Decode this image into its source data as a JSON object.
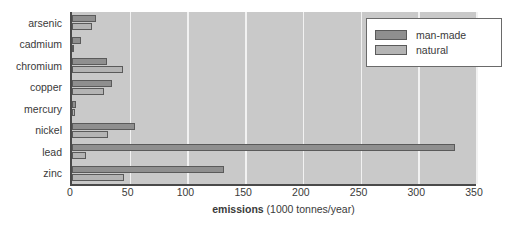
{
  "chart_data": {
    "type": "bar",
    "orientation": "horizontal",
    "title": "",
    "xlabel_strong": "emissions",
    "xlabel_rest": " (1000 tonnes/year)",
    "xlabel": "emissions (1000 tonnes/year)",
    "ylabel": "",
    "categories": [
      "arsenic",
      "cadmium",
      "chromium",
      "copper",
      "mercury",
      "nickel",
      "lead",
      "zinc"
    ],
    "series": [
      {
        "name": "man-made",
        "color": "#8f8f8f",
        "values": [
          21,
          7.5,
          30,
          35,
          3.6,
          55,
          332,
          132
        ]
      },
      {
        "name": "natural",
        "color": "#b4b4b4",
        "values": [
          17,
          1.3,
          44,
          28,
          2.5,
          31,
          12,
          45
        ]
      }
    ],
    "xlim": [
      0,
      350
    ],
    "xticks": [
      0,
      50,
      100,
      150,
      200,
      250,
      300,
      350
    ],
    "xtick_labels": [
      "0",
      "50",
      "100",
      "150",
      "200",
      "250",
      "300",
      "350"
    ],
    "grid": "vertical",
    "grid_color": "#f2f2f2",
    "plot_background": "#c9c9c9",
    "legend_position": "top-right",
    "legend_entries": [
      "man-made",
      "natural"
    ]
  }
}
